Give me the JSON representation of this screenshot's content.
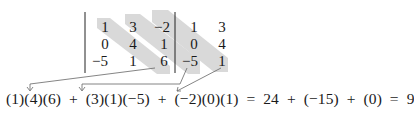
{
  "figure": {
    "matrix": [
      [
        "1",
        "3",
        "−2"
      ],
      [
        "0",
        "4",
        "1"
      ],
      [
        "−5",
        "1",
        "6"
      ]
    ],
    "augmented_columns": [
      [
        "1",
        "3"
      ],
      [
        "0",
        "4"
      ],
      [
        "−5",
        "1"
      ]
    ],
    "highlight_color": "#d9d9d9",
    "arrow_color": "#555555",
    "equation": "(1)(4)(6)  +  (3)(1)(−5)  +  (−2)(0)(1)  =  24  +  (−15)  +  (0)  =  9",
    "products": [
      "(1)(4)(6)",
      "(3)(1)(−5)",
      "(−2)(0)(1)"
    ],
    "product_values": [
      "24",
      "(−15)",
      "(0)"
    ],
    "result": "9"
  }
}
